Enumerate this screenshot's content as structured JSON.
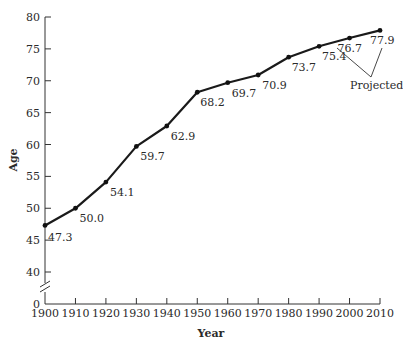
{
  "chart_data": {
    "type": "line",
    "title": "",
    "xlabel": "Year",
    "ylabel": "Age",
    "x": [
      1900,
      1910,
      1920,
      1930,
      1940,
      1950,
      1960,
      1970,
      1980,
      1990,
      2000,
      2010
    ],
    "series": [
      {
        "name": "Life expectancy",
        "values": [
          47.3,
          50.0,
          54.1,
          59.7,
          62.9,
          68.2,
          69.7,
          70.9,
          73.7,
          75.4,
          76.7,
          77.9
        ],
        "labels": [
          "47.3",
          "50.0",
          "54.1",
          "59.7",
          "62.9",
          "68.2",
          "69.7",
          "70.9",
          "73.7",
          "75.4",
          "76.7",
          "77.9"
        ]
      }
    ],
    "xticks": [
      "1900",
      "1910",
      "1920",
      "1930",
      "1940",
      "1950",
      "1960",
      "1970",
      "1980",
      "1990",
      "2000",
      "2010"
    ],
    "yticks": [
      "0",
      "40",
      "45",
      "50",
      "55",
      "60",
      "65",
      "70",
      "75",
      "80"
    ],
    "ylim": [
      40,
      80
    ],
    "y_axis_break": true,
    "grid": false,
    "legend": null,
    "annotations": [
      {
        "text": "Projected",
        "points_to": [
          2000,
          2010
        ]
      }
    ],
    "line_color": "#1a1a1a"
  }
}
